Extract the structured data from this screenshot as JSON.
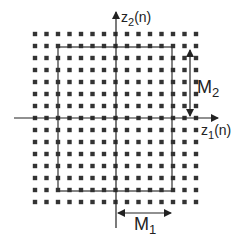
{
  "diagram": {
    "axes": {
      "horizontal_label": "z",
      "horizontal_sub": "1",
      "horizontal_suffix": "(n)",
      "vertical_label": "z",
      "vertical_sub": "2",
      "vertical_suffix": "(n)"
    },
    "dimensions": {
      "m1_label": "M",
      "m1_sub": "1",
      "m2_label": "M",
      "m2_sub": "2"
    },
    "grid": {
      "columns": 15,
      "rows": 15
    },
    "colors": {
      "ink": "#222222",
      "dot": "#333333",
      "background": "#ffffff"
    }
  }
}
